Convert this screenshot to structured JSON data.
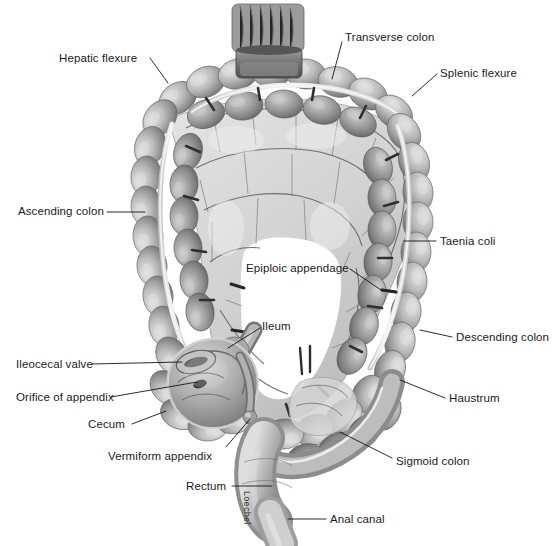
{
  "figure": {
    "artist_signature": "Loechel",
    "palette": {
      "background": "#ffffff",
      "ink": "#1a1a1a",
      "leader_line": "#141414",
      "tissue_dark": "#6e6e6e",
      "tissue_mid": "#9a9a9a",
      "tissue_light": "#c8c8c8",
      "tissue_highlight": "#e2e2e2",
      "taenia_white": "#f2f2f2",
      "mesentery": "#dcdcdc",
      "vessel": "#5a5a5a"
    }
  },
  "labels": [
    {
      "id": "hepatic-flexure",
      "text": "Hepatic flexure",
      "x": 59,
      "y": 52,
      "align": "left",
      "leader": [
        [
          150,
          58
        ],
        [
          168,
          83
        ]
      ]
    },
    {
      "id": "transverse-colon",
      "text": "Transverse colon",
      "x": 345,
      "y": 31,
      "align": "left",
      "leader": [
        [
          342,
          42
        ],
        [
          332,
          79
        ]
      ]
    },
    {
      "id": "splenic-flexure",
      "text": "Splenic flexure",
      "x": 440,
      "y": 67,
      "align": "left",
      "leader": [
        [
          437,
          74
        ],
        [
          412,
          96
        ]
      ]
    },
    {
      "id": "ascending-colon",
      "text": "Ascending colon",
      "x": 18,
      "y": 205,
      "align": "left",
      "leader": [
        [
          107,
          212
        ],
        [
          145,
          212
        ]
      ]
    },
    {
      "id": "taenia-coli",
      "text": "Taenia coli",
      "x": 440,
      "y": 235,
      "align": "left",
      "leader": [
        [
          436,
          241
        ],
        [
          404,
          241
        ]
      ]
    },
    {
      "id": "epiploic-appendage",
      "text": "Epiploic appendage",
      "x": 246,
      "y": 262,
      "align": "left",
      "leader": [
        [
          350,
          269
        ],
        [
          381,
          290
        ]
      ]
    },
    {
      "id": "descending-colon",
      "text": "Descending colon",
      "x": 456,
      "y": 331,
      "align": "left",
      "leader": [
        [
          452,
          337
        ],
        [
          420,
          330
        ]
      ]
    },
    {
      "id": "ileum",
      "text": "Ileum",
      "x": 262,
      "y": 320,
      "align": "left",
      "leader": [
        [
          260,
          328
        ],
        [
          228,
          348
        ]
      ]
    },
    {
      "id": "ileocecal-valve",
      "text": "Ileocecal valve",
      "x": 16,
      "y": 358,
      "align": "left",
      "leader": [
        [
          92,
          364
        ],
        [
          182,
          362
        ]
      ]
    },
    {
      "id": "haustrum",
      "text": "Haustrum",
      "x": 449,
      "y": 392,
      "align": "left",
      "leader": [
        [
          445,
          398
        ],
        [
          400,
          380
        ]
      ]
    },
    {
      "id": "orifice-of-appendix",
      "text": "Orifice of appendix",
      "x": 16,
      "y": 391,
      "align": "left",
      "leader": [
        [
          111,
          397
        ],
        [
          197,
          382
        ]
      ]
    },
    {
      "id": "cecum",
      "text": "Cecum",
      "x": 88,
      "y": 418,
      "align": "left",
      "leader": [
        [
          132,
          424
        ],
        [
          166,
          411
        ]
      ]
    },
    {
      "id": "vermiform-appendix",
      "text": "Vermiform appendix",
      "x": 108,
      "y": 450,
      "align": "left",
      "leader": [
        [
          226,
          447
        ],
        [
          250,
          419
        ]
      ]
    },
    {
      "id": "sigmoid-colon",
      "text": "Sigmoid colon",
      "x": 396,
      "y": 455,
      "align": "left",
      "leader": [
        [
          392,
          458
        ],
        [
          340,
          432
        ]
      ]
    },
    {
      "id": "rectum",
      "text": "Rectum",
      "x": 186,
      "y": 480,
      "align": "left",
      "leader": [
        [
          232,
          486
        ],
        [
          272,
          486
        ]
      ]
    },
    {
      "id": "anal-canal",
      "text": "Anal canal",
      "x": 330,
      "y": 513,
      "align": "left",
      "leader": [
        [
          326,
          519
        ],
        [
          288,
          519
        ]
      ]
    }
  ]
}
